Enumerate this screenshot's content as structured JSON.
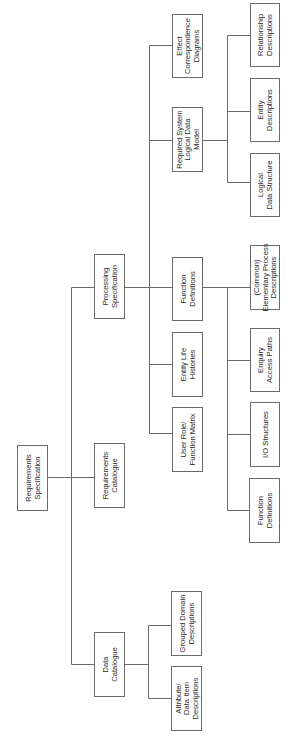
{
  "diagram": {
    "type": "hierarchy",
    "orientation": "rotated-90-ccw",
    "nodes": [
      {
        "id": "req_spec",
        "lines": [
          "Requirements",
          "Specification"
        ],
        "x": 17,
        "y": 445,
        "w": 30,
        "h": 65,
        "parent": null
      },
      {
        "id": "data_cat",
        "lines": [
          "Data",
          "Catalogue"
        ],
        "x": 94,
        "y": 632,
        "w": 30,
        "h": 64,
        "parent": "req_spec"
      },
      {
        "id": "req_cat",
        "lines": [
          "Requirements",
          "Catalogue"
        ],
        "x": 94,
        "y": 443,
        "w": 30,
        "h": 64,
        "parent": "req_spec"
      },
      {
        "id": "proc_spec",
        "lines": [
          "Processing",
          "Specification"
        ],
        "x": 94,
        "y": 254,
        "w": 30,
        "h": 64,
        "parent": "req_spec"
      },
      {
        "id": "attr_desc",
        "lines": [
          "Attribute/",
          "Data Item",
          "Descriptions"
        ],
        "x": 171,
        "y": 666,
        "w": 30,
        "h": 64,
        "parent": "data_cat"
      },
      {
        "id": "grouped_domain",
        "lines": [
          "Grouped Domain",
          "Descriptions"
        ],
        "x": 171,
        "y": 591,
        "w": 30,
        "h": 64,
        "parent": "data_cat"
      },
      {
        "id": "user_role",
        "lines": [
          "User Role/",
          "Function Matrix"
        ],
        "x": 172,
        "y": 407,
        "w": 30,
        "h": 64,
        "parent": "proc_spec"
      },
      {
        "id": "elh",
        "lines": [
          "Entity Life",
          "Histories"
        ],
        "x": 172,
        "y": 332,
        "w": 30,
        "h": 64,
        "parent": "proc_spec"
      },
      {
        "id": "func_defs",
        "lines": [
          "Function",
          "Definitions"
        ],
        "x": 172,
        "y": 257,
        "w": 30,
        "h": 63,
        "parent": "proc_spec"
      },
      {
        "id": "rsldm",
        "lines": [
          "Required System",
          "Logical Data",
          "Model"
        ],
        "x": 172,
        "y": 107,
        "w": 30,
        "h": 64,
        "parent": "proc_spec"
      },
      {
        "id": "ecd",
        "lines": [
          "Effect",
          "Correspondence",
          "Diagrams"
        ],
        "x": 172,
        "y": 14,
        "w": 30,
        "h": 63,
        "parent": "proc_spec"
      },
      {
        "id": "func_defs_2",
        "lines": [
          "Function",
          "Definitions"
        ],
        "x": 249,
        "y": 478,
        "w": 30,
        "h": 64,
        "parent": "func_defs"
      },
      {
        "id": "io_struct",
        "lines": [
          "I/O Structures"
        ],
        "x": 250,
        "y": 402,
        "w": 29,
        "h": 64,
        "parent": "func_defs"
      },
      {
        "id": "enquiry",
        "lines": [
          "Enquiry",
          "Access Paths"
        ],
        "x": 250,
        "y": 328,
        "w": 29,
        "h": 63,
        "parent": "func_defs"
      },
      {
        "id": "epd",
        "lines": [
          "(Common)",
          "Elementary Process",
          "Descriptions"
        ],
        "x": 250,
        "y": 245,
        "w": 29,
        "h": 64,
        "parent": "func_defs"
      },
      {
        "id": "lds",
        "lines": [
          "Logical",
          "Data Structure"
        ],
        "x": 250,
        "y": 153,
        "w": 29,
        "h": 63,
        "parent": "rsldm"
      },
      {
        "id": "entity_desc",
        "lines": [
          "Entity",
          "Descriptions"
        ],
        "x": 250,
        "y": 78,
        "w": 29,
        "h": 63,
        "parent": "rsldm"
      },
      {
        "id": "rel_desc",
        "lines": [
          "Relationship",
          "Descriptions"
        ],
        "x": 250,
        "y": 3,
        "w": 29,
        "h": 63,
        "parent": "rsldm"
      }
    ],
    "connectors": [
      {
        "x1": 47,
        "y1": 477,
        "x2": 94,
        "y2": 477
      },
      {
        "x1": 71,
        "y1": 287,
        "x2": 71,
        "y2": 664
      },
      {
        "x1": 71,
        "y1": 287,
        "x2": 94,
        "y2": 287
      },
      {
        "x1": 71,
        "y1": 664,
        "x2": 94,
        "y2": 664
      },
      {
        "x1": 124,
        "y1": 664,
        "x2": 148,
        "y2": 664
      },
      {
        "x1": 148,
        "y1": 625,
        "x2": 148,
        "y2": 698
      },
      {
        "x1": 148,
        "y1": 625,
        "x2": 171,
        "y2": 625
      },
      {
        "x1": 148,
        "y1": 698,
        "x2": 171,
        "y2": 698
      },
      {
        "x1": 124,
        "y1": 287,
        "x2": 172,
        "y2": 287
      },
      {
        "x1": 149,
        "y1": 45,
        "x2": 149,
        "y2": 433
      },
      {
        "x1": 149,
        "y1": 45,
        "x2": 172,
        "y2": 45
      },
      {
        "x1": 149,
        "y1": 140,
        "x2": 172,
        "y2": 140
      },
      {
        "x1": 149,
        "y1": 364,
        "x2": 172,
        "y2": 364
      },
      {
        "x1": 149,
        "y1": 433,
        "x2": 172,
        "y2": 433
      },
      {
        "x1": 202,
        "y1": 140,
        "x2": 227,
        "y2": 140
      },
      {
        "x1": 227,
        "y1": 35,
        "x2": 227,
        "y2": 182
      },
      {
        "x1": 227,
        "y1": 35,
        "x2": 250,
        "y2": 35
      },
      {
        "x1": 227,
        "y1": 111,
        "x2": 250,
        "y2": 111
      },
      {
        "x1": 227,
        "y1": 182,
        "x2": 250,
        "y2": 182
      },
      {
        "x1": 202,
        "y1": 287,
        "x2": 250,
        "y2": 287
      },
      {
        "x1": 227,
        "y1": 287,
        "x2": 227,
        "y2": 510
      },
      {
        "x1": 227,
        "y1": 360,
        "x2": 250,
        "y2": 360
      },
      {
        "x1": 227,
        "y1": 434,
        "x2": 250,
        "y2": 434
      },
      {
        "x1": 227,
        "y1": 510,
        "x2": 249,
        "y2": 510
      }
    ]
  }
}
